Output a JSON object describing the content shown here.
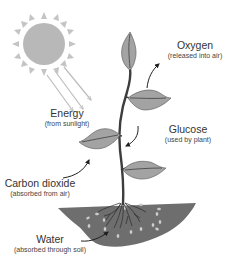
{
  "diagram": {
    "labels": {
      "oxygen": {
        "main": "Oxygen",
        "sub": "(released into air)"
      },
      "energy": {
        "main": "Energy",
        "sub": "(from sunlight)"
      },
      "glucose": {
        "main": "Glucose",
        "sub": "(used by plant)"
      },
      "carbon_dioxide": {
        "main": "Carbon dioxide",
        "sub": "(absorbed from air)"
      },
      "water": {
        "main": "Water",
        "sub": "(absorbed through soil)"
      }
    },
    "elements": [
      "sun",
      "sunlight-rays",
      "plant",
      "leaves",
      "roots",
      "soil"
    ],
    "colors": {
      "sun": "#b8b8b8",
      "leaf": "#a3a3a3",
      "leaf_outline": "#555555",
      "stem": "#3d3d3d",
      "soil": "#6e6e6e",
      "ray": "#bdbdbd",
      "arrow": "#1f1f1f"
    }
  }
}
